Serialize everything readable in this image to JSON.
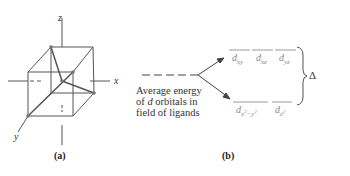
{
  "panel_a": {
    "caption": "(a)",
    "axes": {
      "x": "x",
      "y": "y",
      "z": "z"
    }
  },
  "panel_b": {
    "caption": "(b)",
    "average_label": [
      "Average energy",
      "of d orbitals in",
      "field of ligands"
    ],
    "upper_orbitals": [
      "d_xy",
      "d_xz",
      "d_yz"
    ],
    "lower_orbitals": [
      "d_x2-y2",
      "d_z2"
    ],
    "splitting_label": "Δ"
  }
}
